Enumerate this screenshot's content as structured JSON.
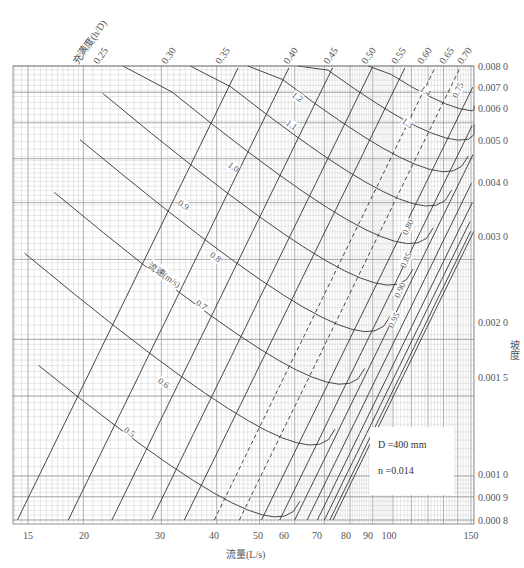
{
  "chart_data": {
    "type": "line",
    "title": "",
    "chart_kind": "hydraulic nomogram (log-log) for circular sewer pipe",
    "xlabel": "流量(L/s)",
    "ylabel": "坡度",
    "x_scale": "log",
    "y_scale": "log",
    "xlim": [
      14,
      155
    ],
    "ylim": [
      0.0008,
      0.008
    ],
    "x_ticks": [
      "15",
      "20",
      "30",
      "40",
      "50",
      "60",
      "70",
      "80",
      "90",
      "100",
      "150"
    ],
    "y_ticks": [
      "0.008 0",
      "0.007 0",
      "0.006 0",
      "0.005 0",
      "0.004 0",
      "0.003 0",
      "0.002 0",
      "0.001 5",
      "0.001 0",
      "0.000 9",
      "0.000 8"
    ],
    "grid": true,
    "parameters": {
      "diameter": "D =400 mm",
      "roughness": "n =0.014"
    },
    "fill_ratio_label": "充满度(h/D)",
    "fill_ratio_lines": [
      "0.25",
      "0.30",
      "0.35",
      "0.40",
      "0.45",
      "0.50",
      "0.55",
      "0.60",
      "0.65",
      "0.70",
      "0.75",
      "0.80",
      "0.85",
      "0.90",
      "0.95"
    ],
    "velocity_label": "流速(m/s)",
    "velocity_lines": [
      "0.5",
      "0.6",
      "0.7",
      "0.8",
      "0.9",
      "1.0",
      "1.1",
      "1.2",
      "1.3",
      "1.4"
    ],
    "series": [
      {
        "name": "h/D=0.25",
        "points": [
          [
            14.2,
            0.0008
          ],
          [
            20,
            0.0017
          ],
          [
            25,
            0.0029
          ],
          [
            30,
            0.0044
          ],
          [
            33,
            0.0056
          ]
        ]
      },
      {
        "name": "h/D=0.50",
        "points": [
          [
            32,
            0.0008
          ],
          [
            45,
            0.0017
          ],
          [
            55,
            0.0029
          ],
          [
            65,
            0.0044
          ],
          [
            75,
            0.0065
          ]
        ]
      },
      {
        "name": "h/D=0.95",
        "points": [
          [
            58,
            0.0008
          ],
          [
            75,
            0.0016
          ],
          [
            90,
            0.0025
          ],
          [
            105,
            0.0036
          ],
          [
            150,
            0.0065
          ]
        ]
      },
      {
        "name": "v=0.5 m/s",
        "points": [
          [
            14,
            0.0018
          ],
          [
            20,
            0.0015
          ],
          [
            30,
            0.0012
          ],
          [
            45,
            0.00095
          ],
          [
            55,
            0.0009
          ]
        ]
      },
      {
        "name": "v=1.0 m/s",
        "points": [
          [
            40,
            0.0078
          ],
          [
            60,
            0.0058
          ],
          [
            80,
            0.0047
          ],
          [
            110,
            0.0041
          ]
        ]
      }
    ]
  }
}
